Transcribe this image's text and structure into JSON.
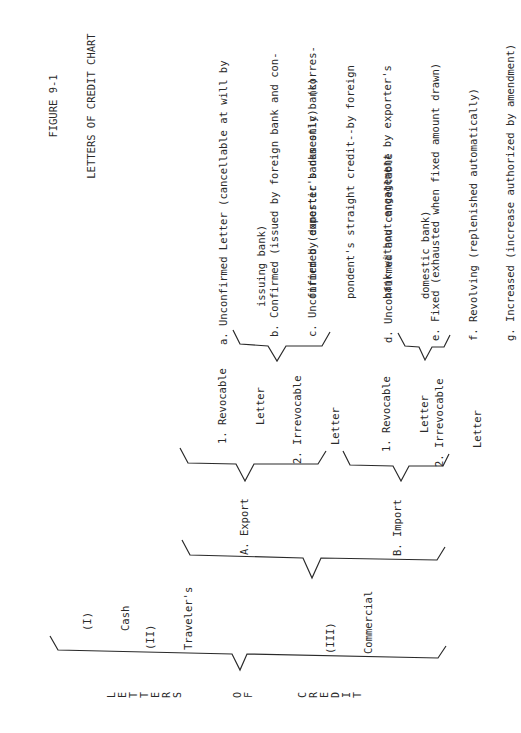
{
  "title": {
    "figure": "FIGURE 9-1",
    "name": "LETTERS OF CREDIT CHART"
  },
  "root": {
    "letters": [
      "L",
      "E",
      "T",
      "T",
      "E",
      "R",
      "S"
    ],
    "of": [
      "O",
      "F"
    ],
    "credit": [
      "C",
      "R",
      "E",
      "D",
      "I",
      "T"
    ]
  },
  "level1": {
    "cash": [
      "(I)",
      "Cash"
    ],
    "travelers": [
      "(II)",
      "Traveler's"
    ],
    "commercial": [
      "(III)",
      "Commercial"
    ]
  },
  "level2": {
    "export": "A. Export",
    "import": "B. Import"
  },
  "level3": {
    "export_revocable": [
      "1. Revocable",
      "   Letter"
    ],
    "export_irrevocable": [
      "2. Irrevocable",
      "   Letter"
    ],
    "import_revocable": [
      "1. Revocable",
      "   Letter"
    ],
    "import_irrevocable": [
      "2. Irrevocable",
      "   Letter"
    ]
  },
  "level4": {
    "a": [
      "a. Unconfirmed Letter (cancellable at will by",
      "      issuing bank)"
    ],
    "b": [
      "b. Confirmed (issued by foreign bank and con-",
      "      firmed by exporter's domestic bank)"
    ],
    "c": [
      "c. Unconfirmed (domestic banks only)  (corres-",
      "      pondent's straight credit--by foreign",
      "      bank without engagement by exporter's",
      "      domestic bank)"
    ],
    "d": [
      "d. Unconfirmed and cancellable"
    ],
    "e": "e. Fixed (exhausted when fixed amount drawn)",
    "f": "f. Revolving (replenished automatically)",
    "g": "g. Increased (increase authorized by amendment)"
  }
}
